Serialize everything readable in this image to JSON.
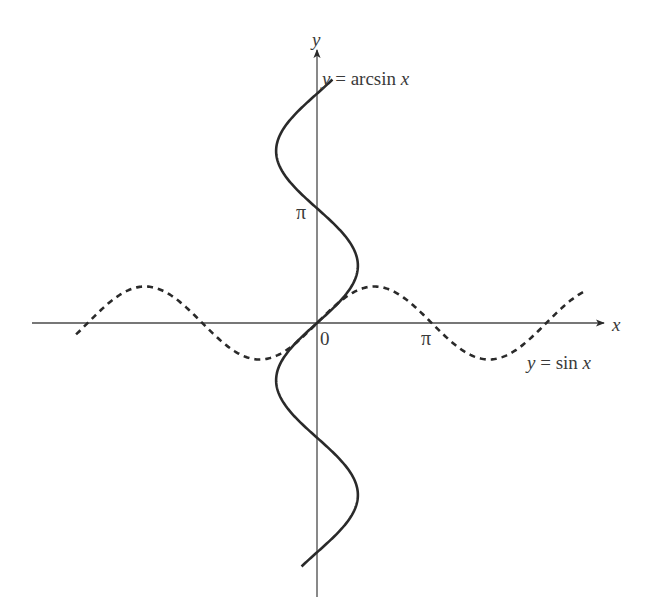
{
  "figure": {
    "axes": {
      "x_label": "x",
      "y_label": "y",
      "origin_label": "0",
      "x_tick_label": "π",
      "y_tick_label": "π"
    },
    "curves": {
      "sin": {
        "label": "y = sin x",
        "style": "dashed",
        "color": "#2a2a2a"
      },
      "arcsin": {
        "label": "y = arcsin x",
        "style": "solid",
        "color": "#2a2a2a"
      }
    },
    "colors": {
      "axis": "#4a4a4a",
      "curve": "#2a2a2a",
      "text": "#3a3a3a",
      "background": "#ffffff"
    }
  },
  "chart_data": {
    "type": "line",
    "title": "",
    "xlabel": "x",
    "ylabel": "y",
    "grid": false,
    "legend": "inline labels",
    "xlim": [
      -7.8,
      7.9
    ],
    "ylim": [
      -7.5,
      7.6
    ],
    "ticks": {
      "x": [
        {
          "value": 0,
          "label": "0"
        },
        {
          "value": 3.14159,
          "label": "π"
        }
      ],
      "y": [
        {
          "value": 3.14159,
          "label": "π"
        }
      ]
    },
    "series": [
      {
        "name": "y = sin x",
        "style": "dashed",
        "x_range": [
          -6.6,
          7.3
        ],
        "function": "y = sin(x)"
      },
      {
        "name": "y = arcsin x",
        "style": "solid",
        "y_range": [
          -6.67,
          6.67
        ],
        "function": "x = sin(y)"
      }
    ]
  }
}
